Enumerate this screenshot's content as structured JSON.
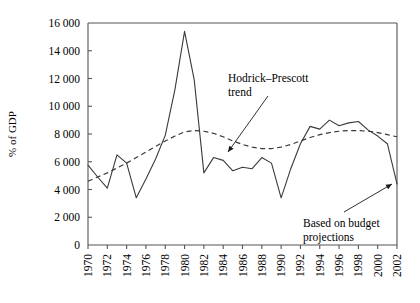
{
  "chart_data": {
    "type": "line",
    "title": "",
    "xlabel": "",
    "ylabel": "% of GDP",
    "xlim": [
      1970,
      2002
    ],
    "ylim": [
      0,
      16000
    ],
    "grid": false,
    "legend_position": "none",
    "ytick_labels": [
      "16 000",
      "14 000",
      "12 000",
      "10 000",
      "8 000",
      "6 000",
      "4 000",
      "2 000",
      "0"
    ],
    "ytick_values": [
      16000,
      14000,
      12000,
      10000,
      8000,
      6000,
      4000,
      2000,
      0
    ],
    "xtick_labels": [
      "1970",
      "1972",
      "1974",
      "1976",
      "1978",
      "1980",
      "1982",
      "1984",
      "1986",
      "1988",
      "1990",
      "1992",
      "1994",
      "1996",
      "1998",
      "2000",
      "2002"
    ],
    "xtick_values": [
      1970,
      1972,
      1974,
      1976,
      1978,
      1980,
      1982,
      1984,
      1986,
      1988,
      1990,
      1992,
      1994,
      1996,
      1998,
      2000,
      2002
    ],
    "x": [
      1970,
      1971,
      1972,
      1973,
      1974,
      1975,
      1976,
      1977,
      1978,
      1979,
      1980,
      1981,
      1982,
      1983,
      1984,
      1985,
      1986,
      1987,
      1988,
      1989,
      1990,
      1991,
      1992,
      1993,
      1994,
      1995,
      1996,
      1997,
      1998,
      1999,
      2000,
      2001,
      2002
    ],
    "series": [
      {
        "name": "Actual",
        "style": "solid",
        "values": [
          5750,
          4900,
          4100,
          6500,
          5900,
          3400,
          4750,
          6200,
          7900,
          11200,
          15400,
          11900,
          5200,
          6300,
          6100,
          5350,
          5600,
          5500,
          6300,
          5900,
          3400,
          5500,
          7300,
          8550,
          8350,
          9000,
          8600,
          8800,
          8900,
          8300,
          7850,
          7300,
          4400
        ]
      },
      {
        "name": "Hodrick–Prescott trend",
        "style": "dashed",
        "values": [
          4600,
          4900,
          5200,
          5550,
          5900,
          6300,
          6700,
          7100,
          7500,
          7850,
          8150,
          8250,
          8200,
          8050,
          7800,
          7500,
          7250,
          7050,
          6950,
          6950,
          7050,
          7250,
          7500,
          7750,
          7950,
          8100,
          8200,
          8250,
          8250,
          8200,
          8100,
          7950,
          7800
        ]
      }
    ],
    "annotations": [
      {
        "id": "hodrick-prescott-trend",
        "text_line1": "Hodrick–Prescott",
        "text_line2": "trend",
        "label_x": 228,
        "label_y": 82,
        "arrow_from_x": 268,
        "arrow_from_y": 96,
        "arrow_to_x": 228,
        "arrow_to_y": 152
      },
      {
        "id": "based-on-budget-projections",
        "text_line1": "Based on budget",
        "text_line2": "projections",
        "label_x": 303,
        "label_y": 227,
        "arrow_from_x": 344,
        "arrow_from_y": 212,
        "arrow_to_x": 392,
        "arrow_to_y": 184
      }
    ]
  },
  "geometry": {
    "plot_left": 88,
    "plot_right": 397,
    "plot_top": 23,
    "plot_bottom": 245
  }
}
